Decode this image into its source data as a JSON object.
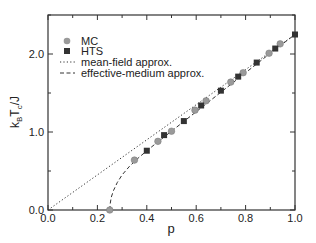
{
  "chart_data": {
    "type": "scatter",
    "title": "",
    "xlabel": "p",
    "ylabel": "k_B T_c / J",
    "xlim": [
      0.0,
      1.0
    ],
    "ylim": [
      0.0,
      2.5
    ],
    "x_ticks": [
      "0.0",
      "0.2",
      "0.4",
      "0.6",
      "0.8",
      "1.0"
    ],
    "y_ticks": [
      "0.0",
      "1.0",
      "2.0"
    ],
    "grid": false,
    "legend_position": "upper left",
    "series": [
      {
        "name": "MC",
        "style": "circle",
        "color": "#9a9a9a",
        "x": [
          0.25,
          0.35,
          0.445,
          0.5,
          0.595,
          0.64,
          0.74,
          0.79,
          0.895,
          0.94
        ],
        "y": [
          0.0,
          0.64,
          0.88,
          1.01,
          1.28,
          1.4,
          1.64,
          1.76,
          2.01,
          2.13
        ]
      },
      {
        "name": "HTS",
        "style": "square",
        "color": "#333333",
        "x": [
          0.4,
          0.47,
          0.55,
          0.62,
          0.7,
          0.77,
          0.845,
          0.92,
          1.0
        ],
        "y": [
          0.76,
          0.96,
          1.14,
          1.34,
          1.53,
          1.71,
          1.89,
          2.07,
          2.25
        ]
      },
      {
        "name": "mean-field approx.",
        "style": "dotted-line",
        "color": "#333333",
        "x": [
          0.0,
          1.0
        ],
        "y": [
          0.0,
          2.25
        ]
      },
      {
        "name": "effective-medium approx.",
        "style": "dashed-line",
        "color": "#333333",
        "x": [
          0.25,
          0.252,
          0.256,
          0.265,
          0.28,
          0.3,
          0.33,
          0.37,
          0.42,
          0.5,
          0.6,
          0.7,
          0.8,
          0.9,
          1.0
        ],
        "y": [
          0.0,
          0.08,
          0.16,
          0.25,
          0.35,
          0.45,
          0.56,
          0.68,
          0.81,
          1.01,
          1.26,
          1.51,
          1.76,
          2.01,
          2.25
        ]
      }
    ]
  },
  "legend": {
    "items": [
      {
        "label": "MC",
        "marker": "circle"
      },
      {
        "label": "HTS",
        "marker": "square"
      },
      {
        "label": "mean-field approx.",
        "marker": "dotted"
      },
      {
        "label": "effective-medium approx.",
        "marker": "dashed"
      }
    ]
  },
  "axes": {
    "xlabel": "p",
    "ylabel_main": "k",
    "ylabel_sub1": "B",
    "ylabel_mid": "T",
    "ylabel_sub2": "c",
    "ylabel_tail": "/J"
  }
}
